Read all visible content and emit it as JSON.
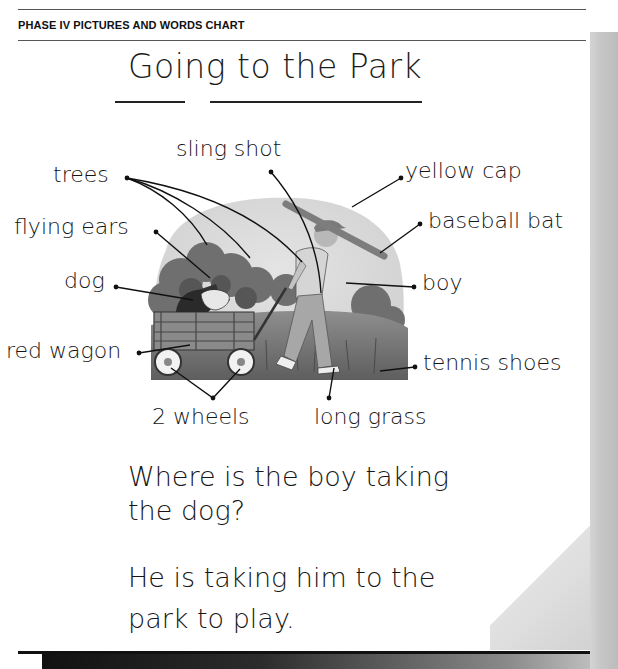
{
  "header": {
    "label": "PHASE IV PICTURES AND WORDS CHART"
  },
  "chart": {
    "title": "Going to the Park",
    "illustration": "boy pulling a dog in a wagon through long grass with trees behind",
    "labels": {
      "sling_shot": "sling shot",
      "trees": "trees",
      "yellow_cap": "yellow cap",
      "flying_ears": "flying ears",
      "baseball_bat": "baseball bat",
      "dog": "dog",
      "boy": "boy",
      "red_wagon": "red wagon",
      "tennis_shoes": "tennis shoes",
      "two_wheels": "2 wheels",
      "long_grass": "long grass"
    },
    "question": {
      "line1": "Where is the boy taking",
      "line2": "the dog?"
    },
    "answer": {
      "line1": "He is taking him to the",
      "line2": "park to play."
    }
  },
  "colors": {
    "ink": "#161616",
    "page_edge": "#c6c6c6",
    "footer": "#111111"
  }
}
